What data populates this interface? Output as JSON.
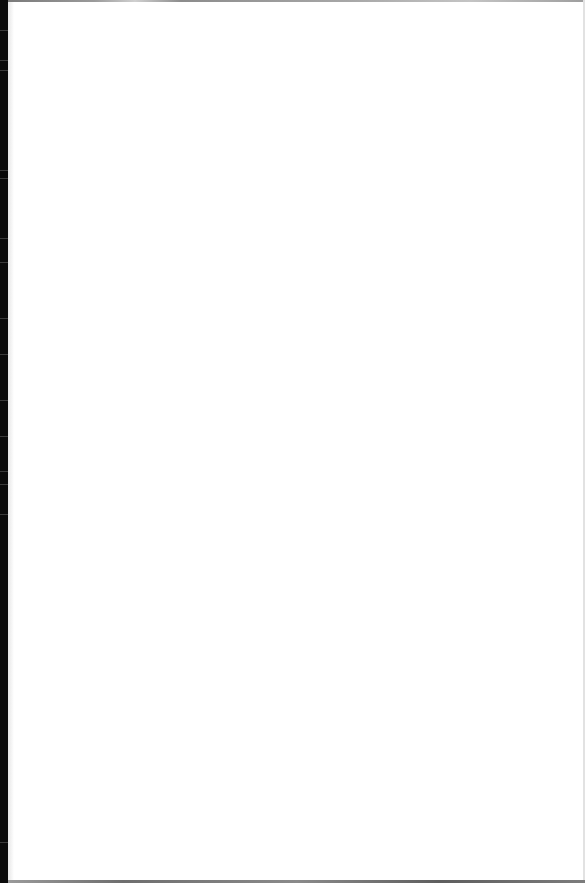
{
  "document": {
    "type": "blank-page",
    "text": "",
    "colors": {
      "paper": "#ffffff",
      "left_edge": "#0a0a0a",
      "border": "#8c8c8c"
    }
  }
}
